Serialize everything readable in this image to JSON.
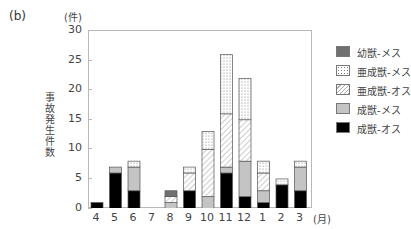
{
  "panel_label": "(b)",
  "y_unit": "(件)",
  "y_title": "事故発生件数",
  "x_unit": "(月)",
  "legend": [
    {
      "key": "juvenile_female",
      "label": "幼獣-メス",
      "pattern": "solid-dark-gray",
      "color": "#707070"
    },
    {
      "key": "subadult_female",
      "label": "亜成獣-メス",
      "pattern": "dotted",
      "color": "#ffffff"
    },
    {
      "key": "subadult_male",
      "label": "亜成獣-オス",
      "pattern": "diagonal-hatch",
      "color": "#ffffff"
    },
    {
      "key": "adult_female",
      "label": "成獣-メス",
      "pattern": "solid-light-gray",
      "color": "#c4c4c4"
    },
    {
      "key": "adult_male",
      "label": "成獣-オス",
      "pattern": "solid-black",
      "color": "#000000"
    }
  ],
  "chart_data": {
    "type": "bar",
    "stacked": true,
    "title": "",
    "xlabel": "(月)",
    "ylabel": "事故発生件数 (件)",
    "ylim": [
      0,
      30
    ],
    "yticks": [
      0,
      5,
      10,
      15,
      20,
      25,
      30
    ],
    "grid": false,
    "legend_position": "right",
    "categories": [
      "4",
      "5",
      "6",
      "7",
      "8",
      "9",
      "10",
      "11",
      "12",
      "1",
      "2",
      "3"
    ],
    "series": [
      {
        "name": "成獣-オス",
        "values": [
          1,
          6,
          3,
          0,
          0,
          3,
          0,
          6,
          2,
          1,
          4,
          3
        ]
      },
      {
        "name": "成獣-メス",
        "values": [
          0,
          1,
          4,
          0,
          1,
          0,
          2,
          1,
          6,
          2,
          0,
          4
        ]
      },
      {
        "name": "亜成獣-オス",
        "values": [
          0,
          0,
          0,
          0,
          1,
          3,
          8,
          9,
          7,
          3,
          0,
          0
        ]
      },
      {
        "name": "亜成獣-メス",
        "values": [
          0,
          0,
          1,
          0,
          0,
          1,
          3,
          10,
          7,
          2,
          1,
          1
        ]
      },
      {
        "name": "幼獣-メス",
        "values": [
          0,
          0,
          0,
          0,
          1,
          0,
          0,
          0,
          0,
          0,
          0,
          0
        ]
      }
    ],
    "totals": [
      1,
      7,
      8,
      0,
      3,
      7,
      13,
      26,
      22,
      8,
      5,
      8
    ]
  }
}
